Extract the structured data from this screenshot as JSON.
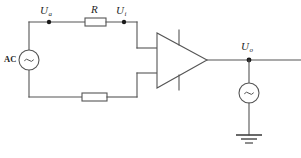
{
  "diagram": {
    "type": "electronic-schematic",
    "background_color": "#ffffff",
    "line_color": "#555555",
    "text_color": "#1f1f1f"
  },
  "labels": {
    "source_ac": "AC",
    "node_input_a": "U",
    "node_input_a_sub": "a",
    "resistor_series": "R",
    "node_input_i": "U",
    "node_input_i_sub": "i",
    "node_output": "U",
    "node_output_sub": "o"
  },
  "components": [
    {
      "name": "ac-source",
      "kind": "ac-voltage-source",
      "symbol": "circle-tilde",
      "label": "AC",
      "cx": 29,
      "cy": 60,
      "r": 10
    },
    {
      "name": "resistor-series",
      "kind": "resistor",
      "symbol": "rectangle",
      "label": "R",
      "x": 85,
      "y": 18,
      "width": 21,
      "height": 8
    },
    {
      "name": "resistor-feedback",
      "kind": "resistor",
      "symbol": "rectangle",
      "label": "",
      "x": 82,
      "y": 93,
      "width": 25,
      "height": 8
    },
    {
      "name": "op-amp",
      "kind": "operational-amplifier",
      "symbol": "triangle",
      "label": "",
      "apex_x": 207,
      "apex_y": 60
    },
    {
      "name": "output-source",
      "kind": "ac-voltage-source",
      "symbol": "circle-tilde",
      "label": "",
      "cx": 249,
      "cy": 93,
      "r": 10
    },
    {
      "name": "ground",
      "kind": "ground",
      "symbol": "earth-three-bar",
      "label": "",
      "x": 249,
      "y": 135
    }
  ],
  "nodes": [
    {
      "name": "node-ua",
      "x": 49,
      "y": 22,
      "label": "U_a"
    },
    {
      "name": "node-ui",
      "x": 124,
      "y": 22,
      "label": "U_i"
    },
    {
      "name": "node-uo",
      "x": 249,
      "y": 60,
      "label": "U_o"
    }
  ]
}
